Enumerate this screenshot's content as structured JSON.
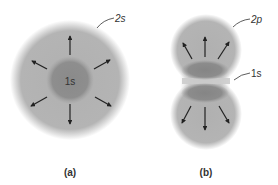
{
  "figure": {
    "panels": [
      {
        "id": "a",
        "caption": "(a)",
        "outer_label": "2s",
        "inner_label": "1s",
        "description": "spherical 2s orbital surrounding 1s core, arrows radiating outward in 8 directions"
      },
      {
        "id": "b",
        "caption": "(b)",
        "outer_label": "2p",
        "inner_label": "1s",
        "description": "dumbbell-shaped 2p orbital with two lobes, arrows radiating outward from each lobe"
      }
    ],
    "colors": {
      "outer_orbital": "#b3b3b3",
      "inner_orbital": "#8c8c8c",
      "arrow": "#222222",
      "text": "#333333",
      "background": "#ffffff"
    }
  }
}
